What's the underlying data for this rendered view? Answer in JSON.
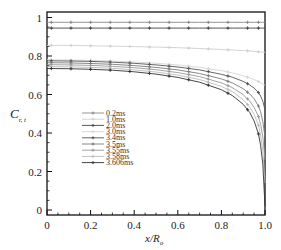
{
  "chart_data": {
    "type": "line",
    "title": "",
    "xlabel": "x/R_o",
    "ylabel": "C_{r,t}",
    "xlim": [
      0,
      1.0
    ],
    "ylim": [
      0,
      1.0
    ],
    "xticks": [
      "0",
      "0.2",
      "0.4",
      "0.6",
      "0.8",
      "1.0"
    ],
    "yticks": [
      "0",
      "0.2",
      "0.4",
      "0.6",
      "0.8",
      "1"
    ],
    "grid": false,
    "legend_position": "center-left",
    "x": [
      0,
      0.1,
      0.2,
      0.3,
      0.4,
      0.5,
      0.6,
      0.7,
      0.8,
      0.85,
      0.9,
      0.93,
      0.95,
      0.97,
      0.98,
      0.99,
      1.0
    ],
    "series": [
      {
        "name": "0.2ms",
        "color": "#8a8a8a",
        "values": [
          0.975,
          0.975,
          0.975,
          0.975,
          0.975,
          0.975,
          0.975,
          0.975,
          0.975,
          0.975,
          0.975,
          0.975,
          0.975,
          0.975,
          0.975,
          0.975,
          0.975
        ]
      },
      {
        "name": "1.0ms",
        "color": "#cfcfcf",
        "values": [
          0.855,
          0.855,
          0.853,
          0.851,
          0.849,
          0.846,
          0.843,
          0.839,
          0.834,
          0.831,
          0.828,
          0.826,
          0.824,
          0.822,
          0.821,
          0.82,
          0.819
        ]
      },
      {
        "name": "2.0ms",
        "color": "#444444",
        "values": [
          0.945,
          0.945,
          0.945,
          0.945,
          0.945,
          0.945,
          0.945,
          0.945,
          0.945,
          0.945,
          0.945,
          0.945,
          0.945,
          0.945,
          0.945,
          0.945,
          0.945
        ]
      },
      {
        "name": "3.0ms",
        "color": "#d5d5d5",
        "values": [
          0.78,
          0.779,
          0.777,
          0.774,
          0.769,
          0.762,
          0.753,
          0.741,
          0.724,
          0.712,
          0.697,
          0.686,
          0.677,
          0.667,
          0.661,
          0.655,
          0.648
        ]
      },
      {
        "name": "3.4ms",
        "color": "#555555",
        "values": [
          0.775,
          0.774,
          0.772,
          0.768,
          0.762,
          0.754,
          0.743,
          0.728,
          0.705,
          0.69,
          0.668,
          0.65,
          0.633,
          0.61,
          0.592,
          0.565,
          0.52
        ]
      },
      {
        "name": "3.5ms",
        "color": "#7a7a7a",
        "values": [
          0.765,
          0.764,
          0.761,
          0.757,
          0.75,
          0.741,
          0.728,
          0.709,
          0.681,
          0.66,
          0.63,
          0.603,
          0.578,
          0.54,
          0.51,
          0.46,
          0.38
        ]
      },
      {
        "name": "3.55ms",
        "color": "#999999",
        "values": [
          0.755,
          0.754,
          0.751,
          0.746,
          0.739,
          0.729,
          0.714,
          0.693,
          0.66,
          0.636,
          0.599,
          0.566,
          0.533,
          0.485,
          0.445,
          0.38,
          0.26
        ]
      },
      {
        "name": "3.58ms",
        "color": "#bbbbbb",
        "values": [
          0.745,
          0.744,
          0.741,
          0.736,
          0.728,
          0.717,
          0.701,
          0.678,
          0.642,
          0.615,
          0.573,
          0.535,
          0.497,
          0.44,
          0.39,
          0.31,
          0.14
        ]
      },
      {
        "name": "3.606ms",
        "color": "#333333",
        "values": [
          0.735,
          0.734,
          0.731,
          0.726,
          0.718,
          0.706,
          0.689,
          0.664,
          0.625,
          0.595,
          0.549,
          0.507,
          0.463,
          0.395,
          0.335,
          0.24,
          0.02
        ]
      }
    ]
  }
}
